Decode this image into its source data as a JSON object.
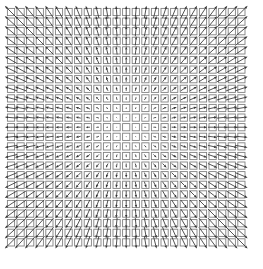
{
  "figure": {
    "width": 263,
    "height": 269,
    "background_color": "#ffffff",
    "has_axes": false,
    "has_frame": false,
    "has_title": false,
    "has_tick_labels": false,
    "has_legend": false
  },
  "chart_data": {
    "type": "scatter",
    "subtype": "quiver",
    "title": "",
    "subtitle": "",
    "xlabel": "",
    "ylabel": "",
    "grid": false,
    "legend": null,
    "annotations": [],
    "xlim": [
      -1.0,
      1.0
    ],
    "ylim": [
      -1.0,
      1.0
    ],
    "xticks": [],
    "yticks": [],
    "xtick_labels": [],
    "ytick_labels": [],
    "grid_layout": {
      "columns": 25,
      "rows": 25,
      "x_start_px": 11,
      "y_start_px": 12,
      "cell_pitch_px": 9.6
    },
    "marker": {
      "shape": "square",
      "filled": false,
      "size_px": 7.2,
      "edge_color": "#808080",
      "edge_width": 0.9,
      "face_color": "none"
    },
    "arrow": {
      "color": "#333333",
      "line_width": 0.85,
      "head_style": "filled-triangle",
      "head_length_px": 3.2,
      "head_width_px": 2.4,
      "max_length_px": 17.5,
      "min_length_px": 0.0,
      "scaling": "linear-with-radius",
      "direction_rule": "u = x - cx, v = y - cy (points away from center)"
    },
    "center": {
      "col": 12,
      "row": 12,
      "x": 0.0,
      "y": 0.0
    },
    "series": [
      {
        "name": "vector field",
        "u_formula": "x",
        "v_formula": "y",
        "magnitude_formula": "sqrt(x^2 + y^2)",
        "sample_count": 625
      }
    ],
    "sample_vectors": [
      {
        "col": 0,
        "row": 0,
        "x": -1.0,
        "y": 1.0,
        "u": -1.0,
        "v": 1.0,
        "magnitude": 1.414,
        "angle_deg": 135
      },
      {
        "col": 12,
        "row": 0,
        "x": 0.0,
        "y": 1.0,
        "u": 0.0,
        "v": 1.0,
        "magnitude": 1.0,
        "angle_deg": 90
      },
      {
        "col": 24,
        "row": 0,
        "x": 1.0,
        "y": 1.0,
        "u": 1.0,
        "v": 1.0,
        "magnitude": 1.414,
        "angle_deg": 45
      },
      {
        "col": 0,
        "row": 12,
        "x": -1.0,
        "y": 0.0,
        "u": -1.0,
        "v": 0.0,
        "magnitude": 1.0,
        "angle_deg": 180
      },
      {
        "col": 12,
        "row": 12,
        "x": 0.0,
        "y": 0.0,
        "u": 0.0,
        "v": 0.0,
        "magnitude": 0.0,
        "angle_deg": 0
      },
      {
        "col": 24,
        "row": 12,
        "x": 1.0,
        "y": 0.0,
        "u": 1.0,
        "v": 0.0,
        "magnitude": 1.0,
        "angle_deg": 0
      },
      {
        "col": 0,
        "row": 24,
        "x": -1.0,
        "y": -1.0,
        "u": -1.0,
        "v": -1.0,
        "magnitude": 1.414,
        "angle_deg": 225
      },
      {
        "col": 12,
        "row": 24,
        "x": 0.0,
        "y": -1.0,
        "u": 0.0,
        "v": -1.0,
        "magnitude": 1.0,
        "angle_deg": 270
      },
      {
        "col": 24,
        "row": 24,
        "x": 1.0,
        "y": -1.0,
        "u": 1.0,
        "v": -1.0,
        "magnitude": 1.414,
        "angle_deg": 315
      }
    ],
    "colors": {
      "background": "#ffffff",
      "marker_edge": "#808080",
      "arrow": "#333333"
    }
  }
}
